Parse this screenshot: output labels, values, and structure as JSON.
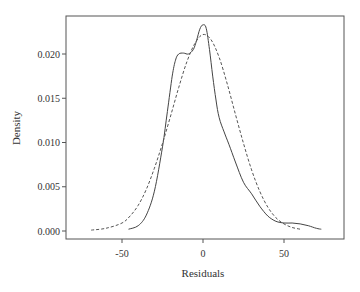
{
  "chart_data": {
    "type": "line",
    "title": "",
    "xlabel": "Residuals",
    "ylabel": "Density",
    "xlim": [
      -75,
      80
    ],
    "ylim": [
      -0.001,
      0.0235
    ],
    "xticks": [
      -50,
      0,
      50
    ],
    "xtick_labels": [
      "-50",
      "0",
      "50"
    ],
    "yticks": [
      0.0,
      0.005,
      0.01,
      0.015,
      0.02
    ],
    "ytick_labels": [
      "0.000",
      "0.005",
      "0.010",
      "0.015",
      "0.020"
    ],
    "grid": false,
    "legend": null,
    "series": [
      {
        "name": "Kernel density (residuals)",
        "style": "solid",
        "color": "#444444",
        "x": [
          -46,
          -40,
          -35,
          -30,
          -25,
          -22,
          -19,
          -17,
          -15,
          -12,
          -9,
          -6,
          -4,
          -2,
          0,
          2,
          4,
          6,
          8,
          10,
          13,
          16,
          20,
          25,
          30,
          35,
          40,
          45,
          50,
          55,
          60,
          65,
          70,
          73
        ],
        "y": [
          0.0002,
          0.0006,
          0.0018,
          0.0045,
          0.0095,
          0.0135,
          0.0175,
          0.0193,
          0.02,
          0.0201,
          0.02,
          0.0205,
          0.0215,
          0.0228,
          0.0233,
          0.0229,
          0.0205,
          0.0175,
          0.0148,
          0.0128,
          0.0112,
          0.0098,
          0.0078,
          0.0055,
          0.0042,
          0.0028,
          0.0017,
          0.0011,
          0.0009,
          0.0009,
          0.0008,
          0.0006,
          0.0003,
          0.0002
        ]
      },
      {
        "name": "Normal density",
        "style": "dashed",
        "color": "#555555",
        "x": [
          -69,
          -60,
          -50,
          -45,
          -40,
          -35,
          -30,
          -25,
          -20,
          -15,
          -10,
          -5,
          0,
          5,
          10,
          15,
          20,
          25,
          30,
          35,
          40,
          45,
          50,
          55,
          60
        ],
        "y": [
          0.0001,
          0.0003,
          0.0009,
          0.0017,
          0.0029,
          0.0047,
          0.0071,
          0.0099,
          0.013,
          0.0162,
          0.0191,
          0.0212,
          0.0222,
          0.0216,
          0.0196,
          0.0166,
          0.0132,
          0.0099,
          0.0069,
          0.0045,
          0.0027,
          0.0015,
          0.0008,
          0.0004,
          0.0002
        ]
      }
    ]
  },
  "axes": {
    "xlabel": "Residuals",
    "ylabel": "Density"
  }
}
